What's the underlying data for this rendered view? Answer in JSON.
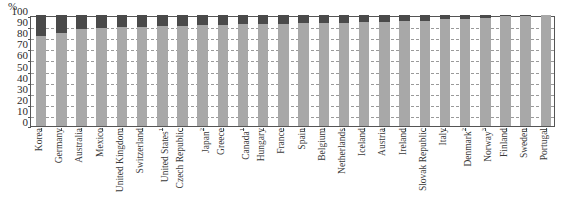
{
  "chart_data": {
    "type": "bar",
    "stacked": true,
    "title": "",
    "xlabel": "",
    "ylabel": "%",
    "ylim": [
      0,
      100
    ],
    "yticks": [
      0,
      10,
      20,
      30,
      40,
      50,
      60,
      70,
      80,
      90,
      100
    ],
    "grid": true,
    "legend": "none",
    "categories": [
      "Korea",
      "Germany",
      "Australia",
      "Mexico",
      "United Kingdom",
      "Switzerland",
      "United States¹",
      "Czech Republic",
      "Japan²",
      "Greece",
      "Canada¹",
      "Hungary",
      "France",
      "Spain",
      "Belgium",
      "Netherlands",
      "Iceland",
      "Austria",
      "Ireland",
      "Slovak Republic",
      "Italy",
      "Denmark²",
      "Norway³",
      "Finland",
      "Sweden",
      "Portugal"
    ],
    "series": [
      {
        "name": "lower-segment",
        "color": "#a8a8a8",
        "values": [
          81,
          84,
          87,
          88,
          89,
          89,
          90,
          90,
          91,
          91,
          92,
          92,
          92,
          93,
          93,
          93,
          94,
          94,
          95,
          95,
          96,
          96,
          97,
          99,
          99,
          100
        ]
      },
      {
        "name": "upper-segment",
        "color": "#4a4a4a",
        "values": [
          19,
          16,
          13,
          12,
          11,
          11,
          10,
          10,
          9,
          9,
          8,
          8,
          8,
          7,
          7,
          7,
          6,
          6,
          5,
          5,
          4,
          4,
          3,
          1,
          1,
          0
        ]
      }
    ]
  },
  "axis": {
    "unit_label": "%"
  },
  "colors": {
    "lower": "#a8a8a8",
    "upper": "#4a4a4a",
    "axis": "#555555",
    "grid": "#9a9a9a",
    "text": "#2b2b2b"
  }
}
